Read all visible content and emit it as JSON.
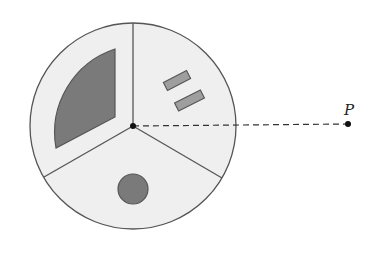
{
  "diagram": {
    "point_label": "P",
    "colors": {
      "background": "#ffffff",
      "disk_fill": "#efefef",
      "stroke": "#555555",
      "dark_fill": "#7a7a7a",
      "medium_fill": "#9e9e9e",
      "point": "#111111"
    },
    "disk": {
      "cx": 133,
      "cy": 126,
      "r": 103,
      "sectors": 3
    },
    "point_p": {
      "x": 348,
      "y": 124
    },
    "shapes": [
      {
        "type": "annular-sector",
        "sector": "upper-left"
      },
      {
        "type": "rectangles",
        "count": 2,
        "sector": "upper-right"
      },
      {
        "type": "circle",
        "sector": "bottom"
      }
    ]
  }
}
